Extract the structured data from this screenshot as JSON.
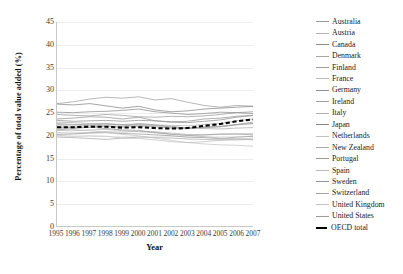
{
  "chart_data": {
    "type": "line",
    "title": "",
    "xlabel": "Year",
    "ylabel": "Percentage of total value added (%)",
    "xlim": [
      1995,
      2007
    ],
    "ylim": [
      0,
      45
    ],
    "ytick_step": 5,
    "grid": true,
    "legend_position": "right",
    "x": [
      1995,
      1996,
      1997,
      1998,
      1999,
      2000,
      2001,
      2002,
      2003,
      2004,
      2005,
      2006,
      2007
    ],
    "yticks": [
      "0",
      "5",
      "10",
      "15",
      "20",
      "25",
      "30",
      "35",
      "40",
      "45"
    ],
    "xticks": [
      "1995",
      "1996",
      "1997",
      "1998",
      "1999",
      "2000",
      "2001",
      "2002",
      "2003",
      "2004",
      "2005",
      "2006",
      "2007"
    ],
    "series": [
      {
        "name": "Australia",
        "color": "#9a9a9a",
        "style": "solid",
        "values": [
          24.6,
          24.4,
          24.3,
          24.6,
          24.4,
          24.1,
          24.0,
          24.2,
          24.1,
          24.3,
          24.6,
          25.0,
          25.2
        ]
      },
      {
        "name": "Austria",
        "color": "#b4b4b4",
        "style": "solid",
        "values": [
          22.4,
          22.3,
          22.5,
          22.6,
          22.4,
          22.5,
          22.3,
          22.2,
          22.1,
          22.4,
          22.6,
          23.2,
          23.6
        ]
      },
      {
        "name": "Canada",
        "color": "#8c8c8c",
        "style": "solid",
        "values": [
          25.1,
          25.0,
          25.2,
          25.3,
          25.5,
          25.8,
          25.2,
          24.9,
          24.6,
          24.8,
          25.1,
          25.0,
          24.8
        ]
      },
      {
        "name": "Denmark",
        "color": "#a6a6a6",
        "style": "solid",
        "values": [
          22.1,
          22.0,
          22.2,
          22.0,
          21.8,
          22.0,
          22.1,
          21.9,
          21.6,
          21.8,
          22.0,
          22.4,
          22.6
        ]
      },
      {
        "name": "Finland",
        "color": "#9e9e9e",
        "style": "solid",
        "values": [
          21.2,
          21.5,
          21.8,
          22.1,
          22.0,
          22.6,
          22.3,
          21.9,
          21.6,
          21.8,
          21.9,
          22.4,
          22.9
        ]
      },
      {
        "name": "France",
        "color": "#bcbcbc",
        "style": "solid",
        "values": [
          20.6,
          20.5,
          20.6,
          20.8,
          20.7,
          20.9,
          20.8,
          20.5,
          20.2,
          20.1,
          20.2,
          20.3,
          20.4
        ]
      },
      {
        "name": "Germany",
        "color": "#909090",
        "style": "solid",
        "values": [
          23.3,
          23.1,
          23.2,
          23.3,
          23.1,
          23.3,
          23.2,
          22.9,
          22.8,
          23.1,
          23.4,
          24.0,
          24.4
        ]
      },
      {
        "name": "Ireland",
        "color": "#a0a0a0",
        "style": "solid",
        "values": [
          27.0,
          27.4,
          28.0,
          28.4,
          28.2,
          28.5,
          27.8,
          28.1,
          27.3,
          26.6,
          26.2,
          26.6,
          26.4
        ]
      },
      {
        "name": "Italy",
        "color": "#b0b0b0",
        "style": "solid",
        "values": [
          22.9,
          22.8,
          22.6,
          22.5,
          22.3,
          22.4,
          22.2,
          21.9,
          21.6,
          21.5,
          21.4,
          21.6,
          21.7
        ]
      },
      {
        "name": "Japan",
        "color": "#868686",
        "style": "solid",
        "values": [
          26.9,
          26.7,
          27.0,
          26.5,
          26.0,
          26.4,
          25.6,
          25.2,
          25.4,
          25.8,
          26.0,
          26.2,
          26.4
        ]
      },
      {
        "name": "Netherlands",
        "color": "#c0c0c0",
        "style": "solid",
        "values": [
          20.0,
          19.8,
          19.9,
          19.8,
          19.4,
          19.3,
          19.0,
          18.6,
          18.4,
          18.6,
          18.9,
          19.2,
          19.4
        ]
      },
      {
        "name": "New Zealand",
        "color": "#aaaaaa",
        "style": "solid",
        "values": [
          19.6,
          19.5,
          19.3,
          19.1,
          19.4,
          19.6,
          19.5,
          19.4,
          19.2,
          19.1,
          19.0,
          19.0,
          19.1
        ]
      },
      {
        "name": "Portugal",
        "color": "#989898",
        "style": "solid",
        "values": [
          20.2,
          20.3,
          20.5,
          20.6,
          20.4,
          20.3,
          20.1,
          19.9,
          19.6,
          19.5,
          19.3,
          19.6,
          19.8
        ]
      },
      {
        "name": "Spain",
        "color": "#b8b8b8",
        "style": "solid",
        "values": [
          21.1,
          21.0,
          21.2,
          21.3,
          21.0,
          20.8,
          20.6,
          20.3,
          20.0,
          19.7,
          19.4,
          19.2,
          19.0
        ]
      },
      {
        "name": "Sweden",
        "color": "#949494",
        "style": "solid",
        "values": [
          23.6,
          23.8,
          24.1,
          24.0,
          23.6,
          24.0,
          23.2,
          23.0,
          23.1,
          23.6,
          23.8,
          24.2,
          24.4
        ]
      },
      {
        "name": "Switzerland",
        "color": "#a2a2a2",
        "style": "solid",
        "values": [
          22.6,
          22.4,
          22.3,
          22.5,
          22.3,
          22.2,
          21.9,
          21.6,
          21.5,
          21.7,
          21.9,
          22.3,
          22.6
        ]
      },
      {
        "name": "United Kingdom",
        "color": "#c4c4c4",
        "style": "solid",
        "values": [
          21.6,
          21.3,
          21.0,
          20.7,
          20.2,
          19.9,
          19.4,
          18.9,
          18.4,
          18.1,
          17.9,
          17.8,
          17.6
        ]
      },
      {
        "name": "United States",
        "color": "#9c9c9c",
        "style": "solid",
        "values": [
          21.8,
          21.7,
          21.8,
          21.5,
          21.2,
          21.1,
          20.6,
          20.2,
          20.0,
          20.1,
          20.3,
          20.3,
          20.1
        ]
      },
      {
        "name": "OECD total",
        "color": "#000000",
        "style": "dashed",
        "values": [
          21.8,
          21.8,
          21.9,
          21.9,
          21.7,
          21.8,
          21.6,
          21.5,
          21.6,
          22.1,
          22.5,
          23.1,
          23.5
        ]
      }
    ]
  }
}
